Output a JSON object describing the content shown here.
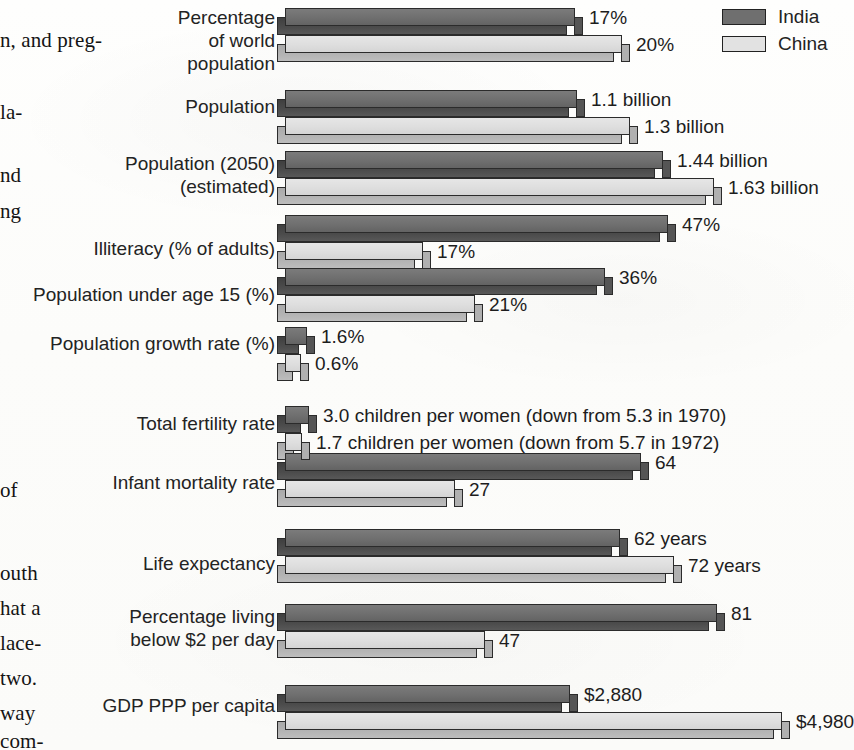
{
  "legend": {
    "items": [
      {
        "name": "India",
        "color": "#6f6f6f"
      },
      {
        "name": "China",
        "color": "#e2e2e2"
      }
    ]
  },
  "margin_text": [
    {
      "text": "n, and preg-",
      "top": 28,
      "left": 0
    },
    {
      "text": "la-",
      "top": 100,
      "left": 0
    },
    {
      "text": "nd",
      "top": 163,
      "left": 0
    },
    {
      "text": "ng",
      "top": 199,
      "left": 0
    },
    {
      "text": "of",
      "top": 478,
      "left": 0
    },
    {
      "text": "outh",
      "top": 561,
      "left": 0
    },
    {
      "text": "hat a",
      "top": 596,
      "left": 0
    },
    {
      "text": "lace-",
      "top": 631,
      "left": 0
    },
    {
      "text": "two.",
      "top": 666,
      "left": 0
    },
    {
      "text": "way",
      "top": 701,
      "left": 0
    },
    {
      "text": "com-",
      "top": 729,
      "left": 0
    }
  ],
  "chart_data": {
    "type": "bar",
    "title": "",
    "xlabel": "",
    "ylabel": "",
    "orientation": "horizontal",
    "grid": false,
    "legend_position": "top-right",
    "series": [
      {
        "name": "India",
        "color": "#6f6f6f"
      },
      {
        "name": "China",
        "color": "#e2e2e2"
      }
    ],
    "categories": [
      "Percentage\nof world\npopulation",
      "Population",
      "Population (2050)\n(estimated)",
      "Illiteracy (% of adults)",
      "Population under age 15 (%)",
      "Population growth rate (%)",
      "Total fertility rate",
      "Infant mortality rate",
      "Life expectancy",
      "Percentage living\nbelow $2 per day",
      "GDP PPP per capita"
    ],
    "rows": [
      {
        "category": "Percentage\nof world\npopulation",
        "label_top": 6,
        "bar_top": 8,
        "india": {
          "value": 17,
          "label": "17%",
          "width": 290
        },
        "china": {
          "value": 20,
          "label": "20%",
          "width": 337
        }
      },
      {
        "category": "Population",
        "label_top": 95,
        "bar_top": 90,
        "india": {
          "value": 1.1,
          "label": "1.1 billion",
          "width": 292
        },
        "china": {
          "value": 1.3,
          "label": "1.3 billion",
          "width": 345
        }
      },
      {
        "category": "Population (2050)\n(estimated)",
        "label_top": 152,
        "bar_top": 151,
        "india": {
          "value": 1.44,
          "label": "1.44 billion",
          "width": 378
        },
        "china": {
          "value": 1.63,
          "label": "1.63 billion",
          "width": 429
        }
      },
      {
        "category": "Illiteracy (% of adults)",
        "label_top": 237,
        "bar_top": 215,
        "india": {
          "value": 47,
          "label": "47%",
          "width": 383
        },
        "china": {
          "value": 17,
          "label": "17%",
          "width": 138
        }
      },
      {
        "category": "Population under age 15 (%)",
        "label_top": 283,
        "bar_top": 268,
        "india": {
          "value": 36,
          "label": "36%",
          "width": 320
        },
        "china": {
          "value": 21,
          "label": "21%",
          "width": 190
        }
      },
      {
        "category": "Population growth rate (%)",
        "label_top": 332,
        "bar_top": 327,
        "india": {
          "value": 1.6,
          "label": "1.6%",
          "width": 22
        },
        "china": {
          "value": 0.6,
          "label": "0.6%",
          "width": 16
        }
      },
      {
        "category": "Total fertility rate",
        "label_top": 412,
        "bar_top": 406,
        "india": {
          "value": 3.0,
          "label": "3.0 children per women (down from 5.3 in 1970)",
          "width": 24
        },
        "china": {
          "value": 1.7,
          "label": "1.7 children per women (down from 5.7 in 1972)",
          "width": 17
        }
      },
      {
        "category": "Infant mortality rate",
        "label_top": 471,
        "bar_top": 453,
        "india": {
          "value": 64,
          "label": "64",
          "width": 356
        },
        "china": {
          "value": 27,
          "label": "27",
          "width": 170
        }
      },
      {
        "category": "Life expectancy",
        "label_top": 552,
        "bar_top": 529,
        "india": {
          "value": 62,
          "label": "62 years",
          "width": 335
        },
        "china": {
          "value": 72,
          "label": "72 years",
          "width": 389
        }
      },
      {
        "category": "Percentage living\nbelow $2 per day",
        "label_top": 605,
        "bar_top": 604,
        "india": {
          "value": 81,
          "label": "81",
          "width": 432
        },
        "china": {
          "value": 47,
          "label": "47",
          "width": 200
        }
      },
      {
        "category": "GDP PPP per capita",
        "label_top": 694,
        "bar_top": 685,
        "india": {
          "value": 2880,
          "label": "$2,880",
          "width": 285
        },
        "china": {
          "value": 4980,
          "label": "$4,980",
          "width": 497
        }
      }
    ]
  }
}
